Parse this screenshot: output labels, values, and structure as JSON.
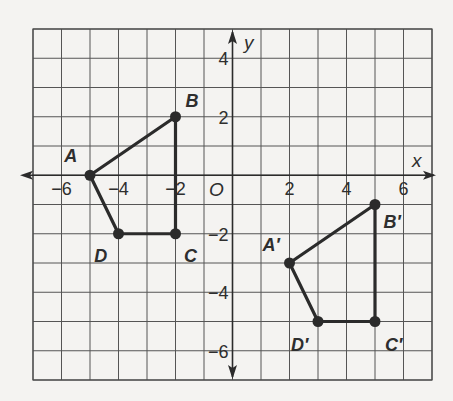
{
  "figure": {
    "type": "coordinate-plane-translation",
    "grid": {
      "xmin": -7,
      "xmax": 7,
      "ymin": -7,
      "ymax": 5,
      "step": 1
    },
    "axes": {
      "x_label": "x",
      "y_label": "y",
      "origin_label": "O",
      "x_ticks": [
        {
          "value": -6,
          "label": "−6"
        },
        {
          "value": -4,
          "label": "−4"
        },
        {
          "value": -2,
          "label": "−2"
        },
        {
          "value": 2,
          "label": "2"
        },
        {
          "value": 4,
          "label": "4"
        },
        {
          "value": 6,
          "label": "6"
        }
      ],
      "y_ticks": [
        {
          "value": 4,
          "label": "4"
        },
        {
          "value": 2,
          "label": "2"
        },
        {
          "value": -2,
          "label": "−2"
        },
        {
          "value": -4,
          "label": "−4"
        },
        {
          "value": -6,
          "label": "−6"
        }
      ]
    },
    "preimage": {
      "name": "ABCD",
      "vertices": [
        {
          "label": "A",
          "x": -5,
          "y": 0,
          "label_dx": -0.9,
          "label_dy": 0.45
        },
        {
          "label": "B",
          "x": -2,
          "y": 2,
          "label_dx": 0.35,
          "label_dy": 0.35
        },
        {
          "label": "C",
          "x": -2,
          "y": -2,
          "label_dx": 0.3,
          "label_dy": -0.95
        },
        {
          "label": "D",
          "x": -4,
          "y": -2,
          "label_dx": -0.85,
          "label_dy": -0.95
        }
      ]
    },
    "image": {
      "name": "A'B'C'D'",
      "vertices": [
        {
          "label": "A′",
          "x": 2,
          "y": -3,
          "label_dx": -0.95,
          "label_dy": 0.4
        },
        {
          "label": "B′",
          "x": 5,
          "y": -1,
          "label_dx": 0.3,
          "label_dy": -0.8
        },
        {
          "label": "C′",
          "x": 5,
          "y": -5,
          "label_dx": 0.35,
          "label_dy": -1.0
        },
        {
          "label": "D′",
          "x": 3,
          "y": -5,
          "label_dx": -0.95,
          "label_dy": -1.0
        }
      ]
    }
  },
  "colors": {
    "ink": "#2b2b2b",
    "grid": "#555555",
    "paper": "#f4f3f1"
  }
}
